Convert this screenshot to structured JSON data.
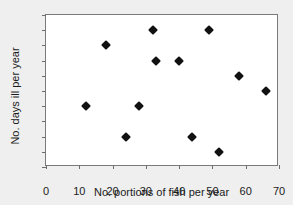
{
  "chart_data": {
    "type": "scatter",
    "title": "",
    "xlabel": "No. portions of fish per year",
    "ylabel": "No. days ill per year",
    "xlim": [
      0,
      70
    ],
    "ylim": [
      0,
      10
    ],
    "xticks": [
      0,
      10,
      20,
      30,
      40,
      50,
      60,
      70
    ],
    "yticks": [
      0,
      1,
      2,
      3,
      4,
      5,
      6,
      7,
      8,
      9,
      10
    ],
    "grid": false,
    "legend": null,
    "marker_style": "filled-diamond",
    "marker_color": "#111111",
    "points": [
      {
        "x": 12,
        "y": 4
      },
      {
        "x": 18,
        "y": 8
      },
      {
        "x": 24,
        "y": 2
      },
      {
        "x": 28,
        "y": 4
      },
      {
        "x": 32,
        "y": 9
      },
      {
        "x": 33,
        "y": 7
      },
      {
        "x": 40,
        "y": 7
      },
      {
        "x": 44,
        "y": 2
      },
      {
        "x": 49,
        "y": 9
      },
      {
        "x": 52,
        "y": 1
      },
      {
        "x": 58,
        "y": 6
      },
      {
        "x": 66,
        "y": 5
      }
    ]
  },
  "style": {
    "background": "#efefef",
    "plot_background": "#ffffff",
    "axis_color": "#7a7a7a"
  }
}
